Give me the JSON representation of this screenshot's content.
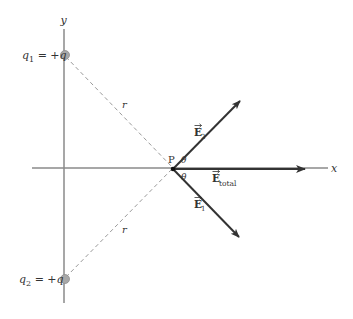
{
  "diagram": {
    "axes": {
      "x_label": "x",
      "y_label": "y"
    },
    "charges": [
      {
        "name": "q1",
        "symbol": "q",
        "subscript": "1",
        "equals": " = +",
        "value": "q",
        "position": "top"
      },
      {
        "name": "q2",
        "symbol": "q",
        "subscript": "2",
        "equals": " = +",
        "value": "q",
        "position": "bottom"
      }
    ],
    "distances": [
      {
        "label": "r",
        "from": "q1",
        "to": "P"
      },
      {
        "label": "r",
        "from": "q2",
        "to": "P"
      }
    ],
    "point": {
      "label": "P"
    },
    "angles": [
      {
        "label": "θ",
        "between": "E2 and x-axis"
      },
      {
        "label": "θ",
        "between": "E1 and x-axis"
      }
    ],
    "vectors": [
      {
        "name": "E2",
        "symbol": "E",
        "subscript": "2",
        "direction": "up-right"
      },
      {
        "name": "E1",
        "symbol": "E",
        "subscript": "1",
        "direction": "down-right"
      },
      {
        "name": "E_total",
        "symbol": "E",
        "subscript": "total",
        "direction": "right"
      }
    ],
    "colors": {
      "axis": "#8a8a8a",
      "charge_fill": "#a8a8a8",
      "vector": "#333333",
      "dashed": "#9a9a9a",
      "text": "#333333"
    }
  }
}
